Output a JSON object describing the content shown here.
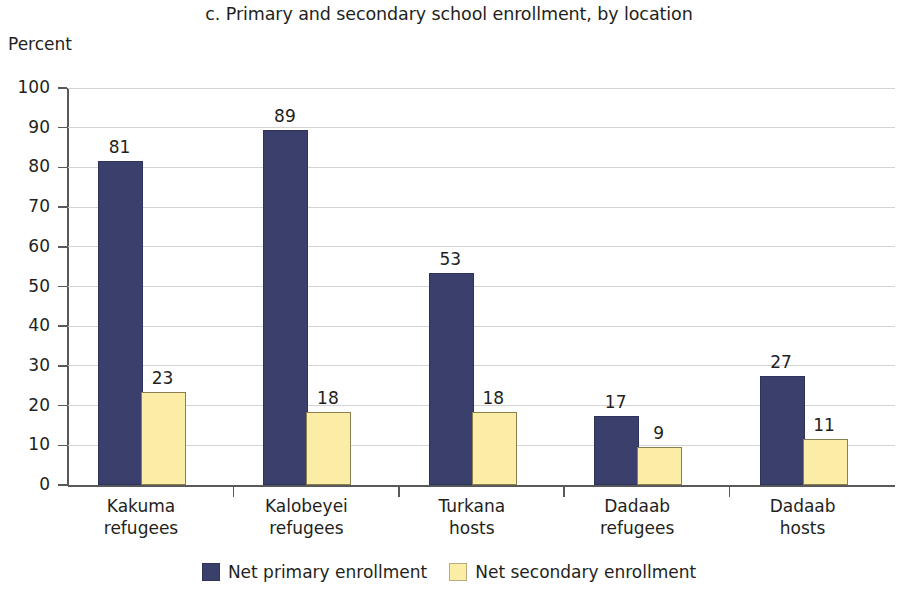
{
  "chart_data": {
    "type": "bar",
    "title": "c. Primary and secondary school enrollment, by location",
    "xlabel": "",
    "ylabel": "Percent",
    "ylim": [
      0,
      100
    ],
    "ytick_step": 10,
    "ytick_labels": [
      "100",
      "90",
      "80",
      "70",
      "60",
      "50",
      "40",
      "30",
      "20",
      "10",
      "0"
    ],
    "grid": true,
    "legend_position": "bottom-center",
    "categories": [
      "Kakuma\nrefugees",
      "Kalobeyei\nrefugees",
      "Turkana\nhosts",
      "Dadaab\nrefugees",
      "Dadaab\nhosts"
    ],
    "series": [
      {
        "name": "Net primary enrollment",
        "color": "#3a3f6b",
        "values": [
          81,
          89,
          53,
          17,
          27
        ]
      },
      {
        "name": "Net secondary enrollment",
        "color": "#fbeca6",
        "values": [
          23,
          18,
          18,
          9,
          11
        ]
      }
    ]
  },
  "colors": {
    "primary": "#3a3f6b",
    "secondary": "#fbeca6",
    "axis": "#58595b",
    "grid": "#d3d3d3",
    "text": "#231f20"
  }
}
